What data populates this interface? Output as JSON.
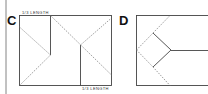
{
  "figures": [
    {
      "id": "C",
      "label": "C",
      "annotations": {
        "top": "1/3 LENGTH",
        "bottom": "1/3 LENGTH"
      }
    },
    {
      "id": "D",
      "label": "D"
    }
  ],
  "colors": {
    "line": "#444444",
    "fold": "#777777"
  }
}
